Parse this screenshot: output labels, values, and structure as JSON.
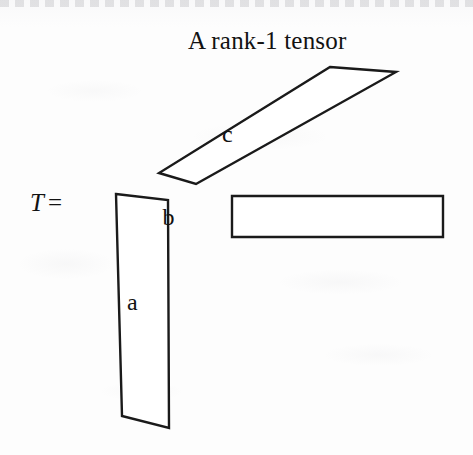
{
  "figure": {
    "title": "A rank-1 tensor",
    "equation": {
      "symbol": "T",
      "operator": "="
    },
    "background_color": "#fdfdfd",
    "stroke_color": "#1a1a1a",
    "fill_color": "#ffffff",
    "factors": [
      {
        "id": "a",
        "label": "a",
        "role": "column-factor",
        "shape": "quadrilateral",
        "points": "116,194 168,200 169,428 122,416",
        "label_x": 127,
        "label_y": 290
      },
      {
        "id": "b",
        "label": "b",
        "role": "row-factor",
        "shape": "rectangle",
        "points": "232,196 443,196 443,237 232,237",
        "label_x": 330,
        "label_y": 205
      },
      {
        "id": "c",
        "label": "c",
        "role": "depth-factor",
        "shape": "parallelogram",
        "points": "330,67 396,72 196,184 159,173",
        "label_x": 222,
        "label_y": 122
      }
    ]
  }
}
